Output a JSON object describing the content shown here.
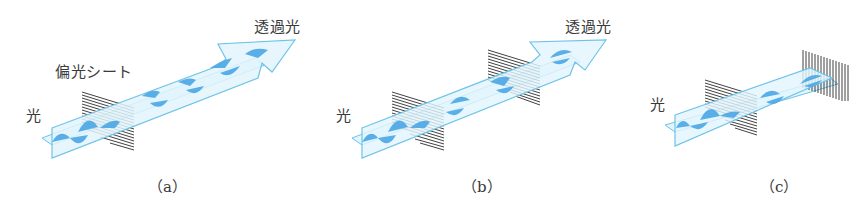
{
  "figure": {
    "colors": {
      "beam_fill": "#e3f5fc",
      "beam_stroke": "#6fc3e8",
      "wave_fill": "#4aa6e6",
      "polarizer_lines": "#2b2b2b",
      "text": "#3a3a3a"
    },
    "panels": [
      {
        "id": "a",
        "caption": "（a）",
        "labels": {
          "incident_light": "光",
          "polarizer": "偏光シート",
          "transmitted_light": "透過光"
        },
        "polarizers": [
          {
            "orientation": "horizontal"
          }
        ]
      },
      {
        "id": "b",
        "caption": "（b）",
        "labels": {
          "incident_light": "光",
          "transmitted_light": "透過光"
        },
        "polarizers": [
          {
            "orientation": "horizontal"
          },
          {
            "orientation": "horizontal"
          }
        ]
      },
      {
        "id": "c",
        "caption": "（c）",
        "labels": {
          "incident_light": "光"
        },
        "polarizers": [
          {
            "orientation": "horizontal"
          },
          {
            "orientation": "vertical"
          }
        ]
      }
    ]
  }
}
